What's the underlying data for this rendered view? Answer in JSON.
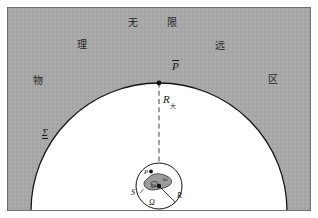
{
  "figure": {
    "colors": {
      "hatched_region": "#a6a6a6",
      "interior": "#ffffff",
      "blob_fill": "#9e9e9e",
      "stroke": "#1a1a1a",
      "frame": "#6e6e6e",
      "page": "#ffffff"
    },
    "frame": {
      "x": 7,
      "y": 7,
      "width": 304,
      "height": 204
    },
    "outer_arc": {
      "center_x": 159,
      "center_y": 211,
      "radius": 128,
      "label_point": "P-tilde"
    },
    "inner_circle": {
      "center_x": 159,
      "center_y": 186,
      "radius": 23
    },
    "labels": {
      "wu": "无",
      "xian": "限",
      "li": "理",
      "yuan": "远",
      "wu_matter": "物",
      "qu": "区",
      "sigma": "Σ",
      "p_tilde": "P",
      "r_big": "R",
      "r_big_sub": "大",
      "r_small": "R",
      "s_surface": "S",
      "omega_cap": "Ω",
      "omega_small": "ω",
      "origin": "O",
      "p_point": "P"
    }
  }
}
